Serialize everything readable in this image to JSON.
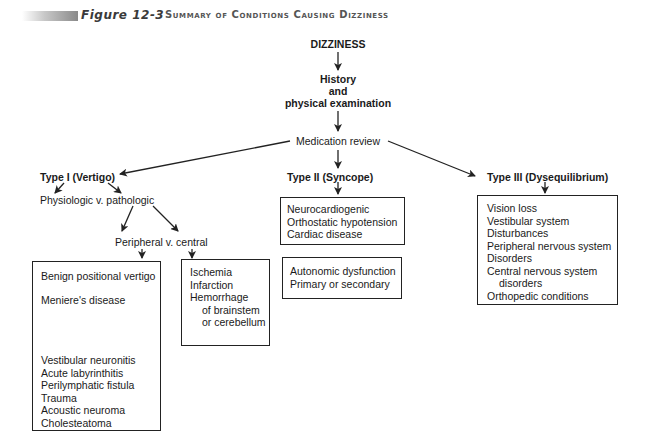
{
  "header": {
    "figure_label": "Figure 12-3",
    "title": "Summary of Conditions Causing Dizziness"
  },
  "flow": {
    "root": "DIZZINESS",
    "step1": [
      "History",
      "and",
      "physical examination"
    ],
    "step2": "Medication review"
  },
  "types": {
    "type1": {
      "label": "Type I (Vertigo)",
      "sub1": "Physiologic v. pathologic",
      "sub2": "Peripheral v. central",
      "peripheral_box": {
        "group1": [
          "Benign  positional vertigo"
        ],
        "group2": [
          "Meniere's disease"
        ],
        "group3": [
          "Vestibular neuronitis",
          "Acute labyrinthitis",
          "Perilymphatic fistula",
          "Trauma",
          "Acoustic neuroma",
          "Cholesteatoma"
        ]
      },
      "central_box": [
        "Ischemia",
        "Infarction",
        "Hemorrhage",
        "of brainstem",
        "or cerebellum"
      ]
    },
    "type2": {
      "label": "Type II (Syncope)",
      "box1": [
        "Neurocardiogenic",
        "Orthostatic hypotension",
        "Cardiac disease"
      ],
      "box2": [
        "Autonomic dysfunction",
        "Primary or secondary"
      ]
    },
    "type3": {
      "label": "Type III (Dysequilibrium)",
      "box": [
        "Vision loss",
        "Vestibular system",
        "Disturbances",
        "Peripheral nervous system",
        "Disorders",
        "Central nervous system",
        "disorders",
        "Orthopedic conditions"
      ]
    }
  }
}
